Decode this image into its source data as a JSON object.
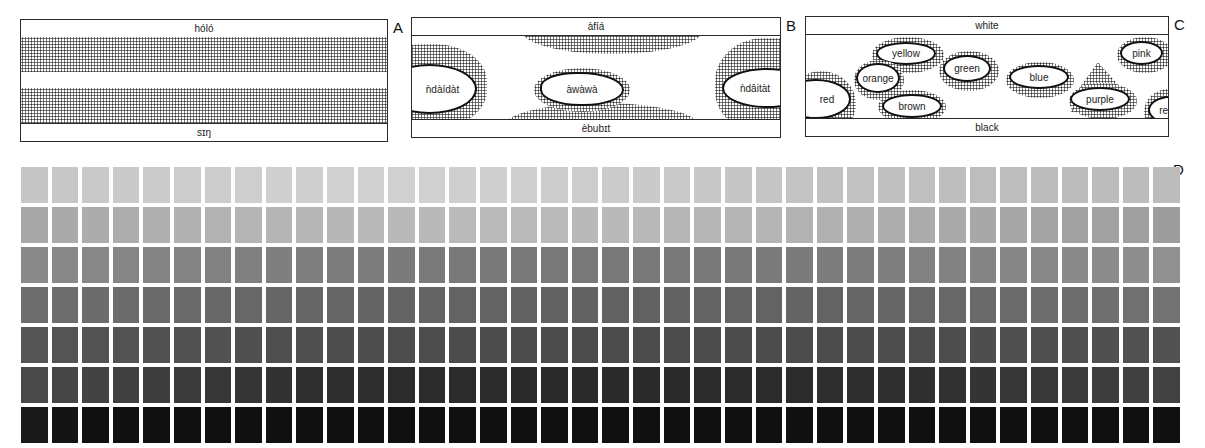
{
  "panels": {
    "A": {
      "letter": "A",
      "top_label": "hóló",
      "bottom_label": "sɪŋ"
    },
    "B": {
      "letter": "B",
      "top_label": "àfíá",
      "bottom_label": "èbubɪt",
      "regions": [
        "ǹdàídàt",
        "àwàwà",
        "ǹdâitàt"
      ]
    },
    "C": {
      "letter": "C",
      "top_label": "white",
      "bottom_label": "black",
      "regions": [
        "red",
        "yellow",
        "orange",
        "brown",
        "green",
        "blue",
        "purple",
        "pink",
        "red"
      ]
    },
    "D": {
      "letter": "D"
    }
  },
  "chart_data": {
    "type": "heatmap",
    "rows": 7,
    "columns": 38,
    "row_labels": [
      "lightest",
      "2",
      "3",
      "4",
      "5",
      "6",
      "darkest"
    ],
    "row_base_gray": [
      "#c6c6c6",
      "#a8a8a8",
      "#8a8a8a",
      "#6e6e6e",
      "#555555",
      "#3a3a3a",
      "#101010"
    ],
    "grid": false,
    "legend": "none"
  }
}
